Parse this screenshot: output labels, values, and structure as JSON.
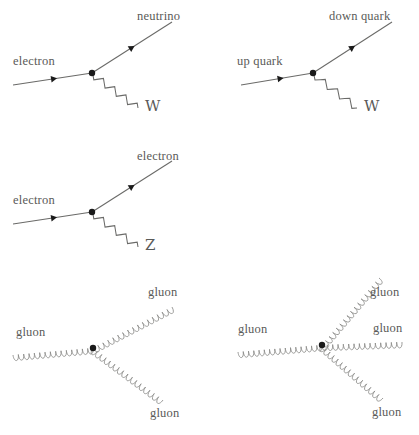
{
  "figure": {
    "title": "",
    "type": "feynman-diagram-set",
    "background_color": "#ffffff",
    "line_color": "#6a6a68",
    "coil_color": "#8a8a88",
    "vertex_color": "#1a1a1a",
    "text_color": "#5a5a58"
  },
  "diagrams": [
    {
      "id": "electron-neutrino-w",
      "name": "charged-current-electron-vertex",
      "vertex": {
        "x": 92,
        "y": 73
      },
      "labels": {
        "incoming": "electron",
        "outgoing": "neutrino",
        "boson": "W"
      },
      "legs": [
        {
          "role": "incoming-fermion",
          "label": "electron",
          "kind": "fermion",
          "x1": 13,
          "y1": 85,
          "x2": 92,
          "y2": 73,
          "arrow_t": 0.52
        },
        {
          "role": "outgoing-fermion",
          "label": "neutrino",
          "kind": "fermion",
          "x1": 92,
          "y1": 73,
          "x2": 172,
          "y2": 22,
          "arrow_t": 0.5
        },
        {
          "role": "boson",
          "label": "W",
          "kind": "wave",
          "x1": 93,
          "y1": 75,
          "x2": 138,
          "y2": 108
        }
      ],
      "label_positions": {
        "incoming": {
          "x": 13,
          "y": 55
        },
        "outgoing": {
          "x": 137,
          "y": 10
        },
        "boson": {
          "x": 145,
          "y": 99
        }
      }
    },
    {
      "id": "up-down-w",
      "name": "charged-current-quark-vertex",
      "vertex": {
        "x": 313,
        "y": 73
      },
      "labels": {
        "incoming": "up quark",
        "outgoing": "down quark",
        "boson": "W"
      },
      "legs": [
        {
          "role": "incoming-fermion",
          "label": "up quark",
          "kind": "fermion",
          "x1": 241,
          "y1": 85,
          "x2": 313,
          "y2": 73,
          "arrow_t": 0.55
        },
        {
          "role": "outgoing-fermion",
          "label": "down quark",
          "kind": "fermion",
          "x1": 313,
          "y1": 73,
          "x2": 392,
          "y2": 22,
          "arrow_t": 0.5
        },
        {
          "role": "boson",
          "label": "W",
          "kind": "wave",
          "x1": 314,
          "y1": 75,
          "x2": 357,
          "y2": 108
        }
      ],
      "label_positions": {
        "incoming": {
          "x": 237,
          "y": 55
        },
        "outgoing": {
          "x": 329,
          "y": 10
        },
        "boson": {
          "x": 364,
          "y": 99
        }
      }
    },
    {
      "id": "electron-electron-z",
      "name": "neutral-current-electron-vertex",
      "vertex": {
        "x": 92,
        "y": 212
      },
      "labels": {
        "incoming": "electron",
        "outgoing": "electron",
        "boson": "Z"
      },
      "legs": [
        {
          "role": "incoming-fermion",
          "label": "electron",
          "kind": "fermion",
          "x1": 13,
          "y1": 224,
          "x2": 92,
          "y2": 212,
          "arrow_t": 0.52
        },
        {
          "role": "outgoing-fermion",
          "label": "electron",
          "kind": "fermion",
          "x1": 92,
          "y1": 212,
          "x2": 172,
          "y2": 161,
          "arrow_t": 0.5
        },
        {
          "role": "boson",
          "label": "Z",
          "kind": "wave",
          "x1": 93,
          "y1": 214,
          "x2": 138,
          "y2": 247
        }
      ],
      "label_positions": {
        "incoming": {
          "x": 13,
          "y": 194
        },
        "outgoing": {
          "x": 137,
          "y": 150
        },
        "boson": {
          "x": 145,
          "y": 238
        }
      }
    },
    {
      "id": "triple-gluon",
      "name": "triple-gluon-vertex",
      "vertex": {
        "x": 93,
        "y": 348
      },
      "labels": {
        "incoming": "gluon",
        "outgoing_upper": "gluon",
        "outgoing_lower": "gluon"
      },
      "legs": [
        {
          "role": "incoming-gluon",
          "label": "gluon",
          "kind": "coil",
          "x1": 13,
          "y1": 355,
          "x2": 93,
          "y2": 348
        },
        {
          "role": "outgoing-gluon-upper",
          "label": "gluon",
          "kind": "coil",
          "x1": 93,
          "y1": 348,
          "x2": 172,
          "y2": 307
        },
        {
          "role": "outgoing-gluon-lower",
          "label": "gluon",
          "kind": "coil",
          "x1": 93,
          "y1": 348,
          "x2": 163,
          "y2": 400
        }
      ],
      "label_positions": {
        "incoming": {
          "x": 16,
          "y": 326
        },
        "outgoing_upper": {
          "x": 148,
          "y": 286
        },
        "outgoing_lower": {
          "x": 150,
          "y": 407
        }
      }
    },
    {
      "id": "quartic-gluon",
      "name": "quartic-gluon-vertex",
      "vertex": {
        "x": 322,
        "y": 345
      },
      "labels": {
        "incoming": "gluon",
        "outgoing_upper": "gluon",
        "outgoing_middle": "gluon",
        "outgoing_lower": "gluon"
      },
      "legs": [
        {
          "role": "incoming-gluon",
          "label": "gluon",
          "kind": "coil",
          "x1": 238,
          "y1": 352,
          "x2": 322,
          "y2": 345
        },
        {
          "role": "outgoing-gluon-upper",
          "label": "gluon",
          "kind": "coil",
          "x1": 322,
          "y1": 345,
          "x2": 379,
          "y2": 278
        },
        {
          "role": "outgoing-gluon-middle",
          "label": "gluon",
          "kind": "coil",
          "x1": 322,
          "y1": 345,
          "x2": 402,
          "y2": 342
        },
        {
          "role": "outgoing-gluon-lower",
          "label": "gluon",
          "kind": "coil",
          "x1": 322,
          "y1": 345,
          "x2": 383,
          "y2": 398
        }
      ],
      "label_positions": {
        "incoming": {
          "x": 238,
          "y": 323
        },
        "outgoing_upper": {
          "x": 370,
          "y": 286
        },
        "outgoing_middle": {
          "x": 373,
          "y": 322
        },
        "outgoing_lower": {
          "x": 372,
          "y": 406
        }
      }
    }
  ]
}
